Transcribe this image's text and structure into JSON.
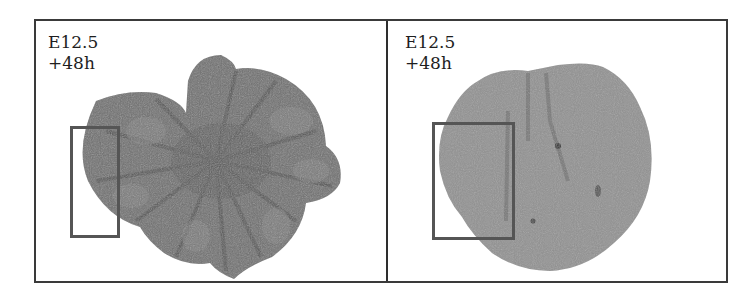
{
  "figure": {
    "panels": [
      {
        "id": "left",
        "stage": "E12.5",
        "time": "+48h",
        "tissue_tone": "#6e6e6e",
        "roi_box": {
          "x": 36,
          "y": 106,
          "w": 48,
          "h": 110
        }
      },
      {
        "id": "right",
        "stage": "E12.5",
        "time": "+48h",
        "tissue_tone": "#8e8e8e",
        "roi_box": {
          "x": 46,
          "y": 102,
          "w": 82,
          "h": 117
        }
      }
    ],
    "colors": {
      "frame": "#3a3a3a",
      "roi": "#555555",
      "background": "#ffffff"
    }
  }
}
